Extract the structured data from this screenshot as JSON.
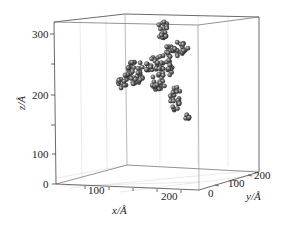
{
  "chart_data": {
    "type": "scatter3d",
    "title": "",
    "xlabel": "x/Å",
    "ylabel": "y/Å",
    "zlabel": "z/Å",
    "xlim": [
      0,
      300
    ],
    "ylim": [
      0,
      250
    ],
    "zlim": [
      0,
      330
    ],
    "xticks": [
      "100",
      "200"
    ],
    "yticks": [
      "0",
      "100",
      "200"
    ],
    "zticks": [
      "0",
      "100",
      "200",
      "300"
    ],
    "grid": true,
    "marker": "sphere",
    "marker_color": "#555555",
    "clusters": [
      {
        "name": "left-small",
        "x_px": 122,
        "y_px": 82,
        "rx": 5,
        "ry": 7,
        "n": 14
      },
      {
        "name": "left-main",
        "x_px": 134,
        "y_px": 72,
        "rx": 10,
        "ry": 12,
        "n": 40
      },
      {
        "name": "center",
        "x_px": 160,
        "y_px": 67,
        "rx": 14,
        "ry": 12,
        "n": 50
      },
      {
        "name": "center-low",
        "x_px": 158,
        "y_px": 84,
        "rx": 8,
        "ry": 6,
        "n": 16
      },
      {
        "name": "top-branch",
        "x_px": 163,
        "y_px": 30,
        "rx": 5,
        "ry": 10,
        "n": 20
      },
      {
        "name": "upper-right",
        "x_px": 177,
        "y_px": 50,
        "rx": 12,
        "ry": 8,
        "n": 34
      },
      {
        "name": "right-column",
        "x_px": 176,
        "y_px": 98,
        "rx": 6,
        "ry": 13,
        "n": 26
      },
      {
        "name": "right-tip",
        "x_px": 187,
        "y_px": 117,
        "rx": 3,
        "ry": 4,
        "n": 6
      }
    ]
  },
  "axes": {
    "x_ticks": [
      {
        "label": "100",
        "x": 97,
        "y": 197
      },
      {
        "label": "200",
        "x": 168,
        "y": 205
      }
    ],
    "y_ticks": [
      {
        "label": "0",
        "x": 210,
        "y": 198
      },
      {
        "label": "100",
        "x": 238,
        "y": 190
      },
      {
        "label": "200",
        "x": 264,
        "y": 180
      }
    ],
    "z_ticks": [
      {
        "label": "300",
        "x": 34,
        "y": 38
      },
      {
        "label": "200",
        "x": 34,
        "y": 98
      },
      {
        "label": "100",
        "x": 34,
        "y": 157
      },
      {
        "label": "0",
        "x": 44,
        "y": 187
      }
    ],
    "x_label": {
      "text": "x/Å",
      "x": 112,
      "y": 217
    },
    "y_label": {
      "text": "y/Å",
      "x": 262,
      "y": 200
    },
    "z_label": {
      "text": "z/Å",
      "x": 20,
      "y": 100
    }
  }
}
